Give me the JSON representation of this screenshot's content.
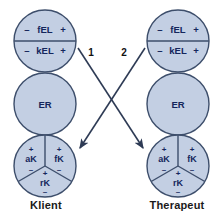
{
  "diagram": {
    "title_text": "",
    "colors": {
      "circle_fill": "#c3cfe3",
      "circle_stroke": "#3d4e6b",
      "text": "#14265c",
      "arrow": "#2e3b55",
      "label": "#1a1a1a",
      "background": "#ffffff"
    },
    "columns": [
      {
        "id": "klient",
        "label": "Klient",
        "circles": [
          {
            "id": "klient-el",
            "name": "el-circle",
            "segments": [
              {
                "id": "klient-fel",
                "minus": "–",
                "label": "fEL",
                "plus": "+"
              },
              {
                "id": "klient-kel",
                "minus": "–",
                "label": "kEL",
                "plus": "+"
              }
            ]
          },
          {
            "id": "klient-er",
            "name": "er-circle",
            "label": "ER"
          },
          {
            "id": "klient-k",
            "name": "k-circle",
            "segments": [
              {
                "id": "klient-ak",
                "plus": "+",
                "label": "aK",
                "minus": "–"
              },
              {
                "id": "klient-fk",
                "plus": "+",
                "label": "fK",
                "minus": "–"
              },
              {
                "id": "klient-rk",
                "plus": "+",
                "label": "rK",
                "minus": "–"
              }
            ]
          }
        ]
      },
      {
        "id": "therapeut",
        "label": "Therapeut",
        "circles": [
          {
            "id": "therapeut-el",
            "name": "el-circle",
            "segments": [
              {
                "id": "therapeut-fel",
                "minus": "–",
                "label": "fEL",
                "plus": "+"
              },
              {
                "id": "therapeut-kel",
                "minus": "–",
                "label": "kEL",
                "plus": "+"
              }
            ]
          },
          {
            "id": "therapeut-er",
            "name": "er-circle",
            "label": "ER"
          },
          {
            "id": "therapeut-k",
            "name": "k-circle",
            "segments": [
              {
                "id": "therapeut-ak",
                "plus": "+",
                "label": "aK",
                "minus": "–"
              },
              {
                "id": "therapeut-fk",
                "plus": "+",
                "label": "fK",
                "minus": "–"
              },
              {
                "id": "therapeut-rk",
                "plus": "+",
                "label": "rK",
                "minus": "–"
              }
            ]
          }
        ]
      }
    ],
    "arrows": [
      {
        "id": "arrow-1",
        "label": "1",
        "from": "klient-el",
        "to": "therapeut-k"
      },
      {
        "id": "arrow-2",
        "label": "2",
        "from": "therapeut-el",
        "to": "klient-k"
      }
    ]
  }
}
